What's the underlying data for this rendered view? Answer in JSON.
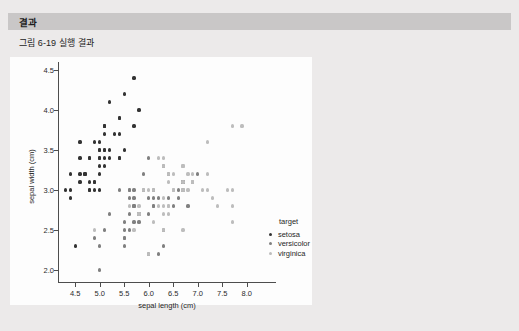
{
  "section": {
    "header_title": "결과"
  },
  "figure": {
    "caption": "그림 6-19 실행 결과"
  },
  "colors": {
    "page_background": "#eceaea",
    "header_bar": "#c9c7c7",
    "figure_background": "#fdfdfd",
    "axis": "#4d4d4d",
    "setosa": "#333333",
    "versicolor": "#808080",
    "virginica": "#bdbdbd"
  },
  "chart_data": {
    "type": "scatter",
    "title": "",
    "xlabel": "sepal length (cm)",
    "ylabel": "sepal width (cm)",
    "xlim": [
      4.15,
      8.35
    ],
    "ylim": [
      1.85,
      4.6
    ],
    "xticks": [
      "4.5",
      "5.0",
      "5.5",
      "6.0",
      "6.5",
      "7.0",
      "7.5",
      "8.0"
    ],
    "xtick_values": [
      4.5,
      5.0,
      5.5,
      6.0,
      6.5,
      7.0,
      7.5,
      8.0
    ],
    "yticks": [
      "2.0",
      "2.5",
      "3.0",
      "3.5",
      "4.0",
      "4.5"
    ],
    "ytick_values": [
      2.0,
      2.5,
      3.0,
      3.5,
      4.0,
      4.5
    ],
    "grid": false,
    "legend_position": "right",
    "legend_title": "target",
    "series": [
      {
        "name": "setosa",
        "color": "#333333",
        "points": [
          [
            5.1,
            3.5
          ],
          [
            4.9,
            3.0
          ],
          [
            4.7,
            3.2
          ],
          [
            4.6,
            3.1
          ],
          [
            5.0,
            3.6
          ],
          [
            5.4,
            3.9
          ],
          [
            4.6,
            3.4
          ],
          [
            5.0,
            3.4
          ],
          [
            4.4,
            2.9
          ],
          [
            4.9,
            3.1
          ],
          [
            5.4,
            3.7
          ],
          [
            4.8,
            3.4
          ],
          [
            4.8,
            3.0
          ],
          [
            4.3,
            3.0
          ],
          [
            5.8,
            4.0
          ],
          [
            5.7,
            4.4
          ],
          [
            5.4,
            3.9
          ],
          [
            5.1,
            3.5
          ],
          [
            5.7,
            3.8
          ],
          [
            5.1,
            3.8
          ],
          [
            5.4,
            3.4
          ],
          [
            5.1,
            3.7
          ],
          [
            4.6,
            3.6
          ],
          [
            5.1,
            3.3
          ],
          [
            4.8,
            3.4
          ],
          [
            5.0,
            3.0
          ],
          [
            5.0,
            3.4
          ],
          [
            5.2,
            3.5
          ],
          [
            5.2,
            3.4
          ],
          [
            4.7,
            3.2
          ],
          [
            4.8,
            3.1
          ],
          [
            5.4,
            3.4
          ],
          [
            5.2,
            4.1
          ],
          [
            5.5,
            4.2
          ],
          [
            4.9,
            3.1
          ],
          [
            5.0,
            3.2
          ],
          [
            5.5,
            3.5
          ],
          [
            4.9,
            3.6
          ],
          [
            4.4,
            3.0
          ],
          [
            5.1,
            3.4
          ],
          [
            5.0,
            3.5
          ],
          [
            4.5,
            2.3
          ],
          [
            4.4,
            3.2
          ],
          [
            5.0,
            3.5
          ],
          [
            5.1,
            3.8
          ],
          [
            4.8,
            3.0
          ],
          [
            5.1,
            3.8
          ],
          [
            4.6,
            3.2
          ],
          [
            5.3,
            3.7
          ],
          [
            5.0,
            3.3
          ]
        ]
      },
      {
        "name": "versicolor",
        "color": "#808080",
        "points": [
          [
            7.0,
            3.2
          ],
          [
            6.4,
            3.2
          ],
          [
            6.9,
            3.1
          ],
          [
            5.5,
            2.3
          ],
          [
            6.5,
            2.8
          ],
          [
            5.7,
            2.8
          ],
          [
            6.3,
            3.3
          ],
          [
            4.9,
            2.4
          ],
          [
            6.6,
            2.9
          ],
          [
            5.2,
            2.7
          ],
          [
            5.0,
            2.0
          ],
          [
            5.9,
            3.0
          ],
          [
            6.0,
            2.2
          ],
          [
            6.1,
            2.9
          ],
          [
            5.6,
            2.9
          ],
          [
            6.7,
            3.1
          ],
          [
            5.6,
            3.0
          ],
          [
            5.8,
            2.7
          ],
          [
            6.2,
            2.2
          ],
          [
            5.6,
            2.5
          ],
          [
            5.9,
            3.2
          ],
          [
            6.1,
            2.8
          ],
          [
            6.3,
            2.5
          ],
          [
            6.1,
            2.8
          ],
          [
            6.4,
            2.9
          ],
          [
            6.6,
            3.0
          ],
          [
            6.8,
            2.8
          ],
          [
            6.7,
            3.0
          ],
          [
            6.0,
            2.9
          ],
          [
            5.7,
            2.6
          ],
          [
            5.5,
            2.4
          ],
          [
            5.5,
            2.4
          ],
          [
            5.8,
            2.7
          ],
          [
            6.0,
            2.7
          ],
          [
            5.4,
            3.0
          ],
          [
            6.0,
            3.4
          ],
          [
            6.7,
            3.1
          ],
          [
            6.3,
            2.3
          ],
          [
            5.6,
            3.0
          ],
          [
            5.5,
            2.5
          ],
          [
            5.5,
            2.6
          ],
          [
            6.1,
            3.0
          ],
          [
            5.8,
            2.6
          ],
          [
            5.0,
            2.3
          ],
          [
            5.6,
            2.7
          ],
          [
            5.7,
            3.0
          ],
          [
            5.7,
            2.9
          ],
          [
            6.2,
            2.9
          ],
          [
            5.1,
            2.5
          ],
          [
            5.7,
            2.8
          ]
        ]
      },
      {
        "name": "virginica",
        "color": "#bdbdbd",
        "points": [
          [
            6.3,
            3.3
          ],
          [
            5.8,
            2.7
          ],
          [
            7.1,
            3.0
          ],
          [
            6.3,
            2.9
          ],
          [
            6.5,
            3.0
          ],
          [
            7.6,
            3.0
          ],
          [
            4.9,
            2.5
          ],
          [
            7.3,
            2.9
          ],
          [
            6.7,
            2.5
          ],
          [
            7.2,
            3.6
          ],
          [
            6.5,
            3.2
          ],
          [
            6.4,
            2.7
          ],
          [
            6.8,
            3.0
          ],
          [
            5.7,
            2.5
          ],
          [
            5.8,
            2.8
          ],
          [
            6.4,
            3.2
          ],
          [
            6.5,
            3.0
          ],
          [
            7.7,
            3.8
          ],
          [
            7.7,
            2.6
          ],
          [
            6.0,
            2.2
          ],
          [
            6.9,
            3.2
          ],
          [
            5.6,
            2.8
          ],
          [
            7.7,
            2.8
          ],
          [
            6.3,
            2.7
          ],
          [
            6.7,
            3.3
          ],
          [
            7.2,
            3.2
          ],
          [
            6.2,
            2.8
          ],
          [
            6.1,
            3.0
          ],
          [
            6.4,
            2.8
          ],
          [
            7.2,
            3.0
          ],
          [
            7.4,
            2.8
          ],
          [
            7.9,
            3.8
          ],
          [
            6.4,
            2.8
          ],
          [
            6.3,
            2.8
          ],
          [
            6.1,
            2.6
          ],
          [
            7.7,
            3.0
          ],
          [
            6.3,
            3.4
          ],
          [
            6.4,
            3.1
          ],
          [
            6.0,
            3.0
          ],
          [
            6.9,
            3.1
          ],
          [
            6.7,
            3.1
          ],
          [
            6.9,
            3.1
          ],
          [
            5.8,
            2.7
          ],
          [
            6.8,
            3.2
          ],
          [
            6.7,
            3.3
          ],
          [
            6.7,
            3.0
          ],
          [
            6.3,
            2.5
          ],
          [
            6.5,
            3.0
          ],
          [
            6.2,
            3.4
          ],
          [
            5.9,
            3.0
          ]
        ]
      }
    ]
  }
}
